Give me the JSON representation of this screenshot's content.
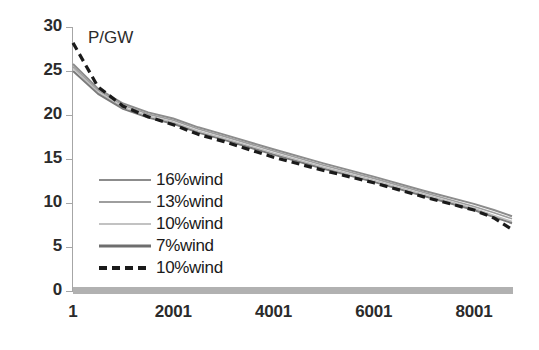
{
  "chart_data": {
    "type": "line",
    "title": "",
    "unit_label": "P/GW",
    "xlabel": "",
    "ylabel": "",
    "xlim": [
      1,
      8760
    ],
    "ylim": [
      0,
      30
    ],
    "y_ticks": [
      30,
      25,
      20,
      15,
      10,
      5,
      0
    ],
    "x_ticks": [
      1,
      2001,
      4001,
      6001,
      8001
    ],
    "grid": false,
    "legend_position": "inside-left",
    "x": [
      1,
      500,
      1000,
      1500,
      2001,
      2500,
      3000,
      4001,
      5000,
      6001,
      7000,
      8001,
      8400,
      8760
    ],
    "series": [
      {
        "name": "16%wind",
        "style": "solid",
        "color": "#8c8c8c",
        "width": 2.0,
        "values": [
          25.8,
          23.0,
          21.3,
          20.3,
          19.6,
          18.6,
          17.8,
          16.1,
          14.5,
          13.0,
          11.4,
          9.9,
          9.2,
          8.5
        ]
      },
      {
        "name": "13%wind",
        "style": "solid",
        "color": "#9e9e9e",
        "width": 1.6,
        "values": [
          25.5,
          22.8,
          21.1,
          20.1,
          19.4,
          18.4,
          17.6,
          15.9,
          14.3,
          12.8,
          11.2,
          9.6,
          8.9,
          8.2
        ]
      },
      {
        "name": "10%wind",
        "style": "solid",
        "color": "#bdbdbd",
        "width": 1.4,
        "values": [
          25.3,
          22.6,
          20.9,
          19.9,
          19.2,
          18.2,
          17.4,
          15.7,
          14.1,
          12.6,
          11.0,
          9.4,
          8.6,
          7.9
        ]
      },
      {
        "name": "7%wind",
        "style": "solid",
        "color": "#7a7a7a",
        "width": 2.0,
        "values": [
          25.0,
          22.4,
          20.7,
          19.7,
          19.0,
          18.0,
          17.2,
          15.5,
          13.9,
          12.4,
          10.8,
          9.2,
          8.4,
          7.7
        ]
      },
      {
        "name": "10%wind",
        "style": "dashed",
        "color": "#1a1a1a",
        "width": 3.2,
        "values": [
          28.2,
          23.2,
          21.0,
          19.8,
          18.9,
          17.8,
          17.0,
          15.2,
          13.7,
          12.3,
          10.7,
          9.2,
          8.3,
          7.0
        ]
      }
    ],
    "legend": [
      {
        "label": "16%wind",
        "style": "solid",
        "color": "#8c8c8c",
        "width": 2
      },
      {
        "label": "13%wind",
        "style": "solid",
        "color": "#9e9e9e",
        "width": 2
      },
      {
        "label": "10%wind",
        "style": "solid",
        "color": "#c2c2c2",
        "width": 2
      },
      {
        "label": "7%wind",
        "style": "solid",
        "color": "#6e6e6e",
        "width": 3
      },
      {
        "label": "10%wind",
        "style": "dashed",
        "color": "#1a1a1a",
        "width": 4
      }
    ]
  },
  "axis": {
    "axis_color": "#a6a6a6",
    "baseline_color": "#a3a3a3"
  }
}
